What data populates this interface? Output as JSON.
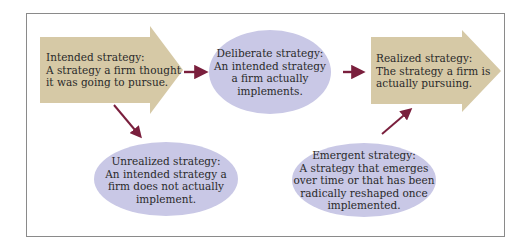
{
  "colors": {
    "arrow_fill": "#d6c9a6",
    "ellipse_fill": "#c9c8e6",
    "connector": "#7a1f3d",
    "frame_border": "#8a8a8a",
    "text": "#2a2a2a"
  },
  "nodes": {
    "intended": {
      "shape": "block-arrow",
      "lines": [
        "Intended strategy:",
        "A strategy a firm thought",
        "it was going to pursue."
      ]
    },
    "deliberate": {
      "shape": "ellipse",
      "lines": [
        "Deliberate strategy:",
        "An intended strategy",
        "a firm actually",
        "implements."
      ]
    },
    "realized": {
      "shape": "block-arrow",
      "lines": [
        "Realized strategy:",
        "The strategy a firm is",
        "actually pursuing."
      ]
    },
    "unrealized": {
      "shape": "ellipse",
      "lines": [
        "Unrealized strategy:",
        "An intended strategy a",
        "firm does not actually",
        "implement."
      ]
    },
    "emergent": {
      "shape": "ellipse",
      "lines": [
        "Emergent strategy:",
        "A strategy that emerges",
        "over time or that has been",
        "radically reshaped once",
        "implemented."
      ]
    }
  },
  "edges": [
    {
      "from": "intended",
      "to": "deliberate"
    },
    {
      "from": "deliberate",
      "to": "realized"
    },
    {
      "from": "intended",
      "to": "unrealized"
    },
    {
      "from": "emergent",
      "to": "realized"
    }
  ]
}
